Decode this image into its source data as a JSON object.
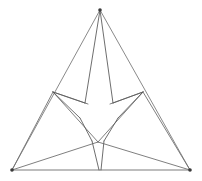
{
  "figure": {
    "background_color": "#ffffff",
    "line_color": "#7a7a7a",
    "accent_color": "#3a3a3a",
    "width": 202,
    "height": 181
  },
  "vertices": {
    "apex": {
      "label": "A",
      "x": 100,
      "y": 10
    },
    "bottom_left": {
      "label": "B",
      "x": 12,
      "y": 170
    },
    "bottom_right": {
      "label": "C",
      "x": 190,
      "y": 170
    },
    "mid_left": {
      "label": "M1",
      "x": 53,
      "y": 92
    },
    "mid_right": {
      "label": "M2",
      "x": 143,
      "y": 92
    },
    "mid_bottom": {
      "label": "M3",
      "x": 98,
      "y": 142
    },
    "notch_top_left": {
      "label": "N1",
      "x": 85,
      "y": 103
    },
    "notch_top_right": {
      "label": "N2",
      "x": 113,
      "y": 103
    },
    "notch_left": {
      "label": "N3",
      "x": 80,
      "y": 118
    },
    "notch_right": {
      "label": "N4",
      "x": 118,
      "y": 118
    },
    "star_bottom_left": {
      "label": "S1",
      "x": 92,
      "y": 141
    },
    "star_bottom_right": {
      "label": "S2",
      "x": 104,
      "y": 141
    },
    "star_center": {
      "label": "O",
      "x": 99,
      "y": 112
    }
  },
  "edges": {
    "outer_triangle": [
      {
        "name": "left-edge",
        "from": "apex",
        "to": "bottom_left"
      },
      {
        "name": "right-edge",
        "from": "apex",
        "to": "bottom_right"
      },
      {
        "name": "base-edge",
        "from": "bottom_left",
        "to": "bottom_right"
      }
    ],
    "medial_triangle": [
      {
        "name": "medial-top",
        "from": "mid_left",
        "to": "mid_right"
      },
      {
        "name": "medial-left",
        "from": "mid_left",
        "to": "mid_bottom"
      },
      {
        "name": "medial-right",
        "from": "mid_right",
        "to": "mid_bottom"
      }
    ],
    "cevians": [
      {
        "name": "apex-to-mid-left",
        "from": "apex",
        "to": "mid_left"
      },
      {
        "name": "apex-to-mid-right",
        "from": "apex",
        "to": "mid_right"
      },
      {
        "name": "left-to-mid-left",
        "from": "bottom_left",
        "to": "mid_left"
      },
      {
        "name": "right-to-mid-right",
        "from": "bottom_right",
        "to": "mid_right"
      },
      {
        "name": "left-to-mid-bottom",
        "from": "bottom_left",
        "to": "mid_bottom"
      },
      {
        "name": "right-to-mid-bottom",
        "from": "bottom_right",
        "to": "mid_bottom"
      }
    ],
    "star_arms": [
      {
        "name": "star-arm-top-left",
        "from": "apex",
        "to": "notch_top_left"
      },
      {
        "name": "star-arm-top-right",
        "from": "apex",
        "to": "notch_top_right"
      },
      {
        "name": "star-arm-left-upper",
        "from": "mid_left",
        "to": "notch_left"
      },
      {
        "name": "star-arm-right-upper",
        "from": "mid_right",
        "to": "notch_right"
      },
      {
        "name": "star-arm-bottom-left",
        "from": "bottom_left",
        "to": "star_bottom_left"
      },
      {
        "name": "star-arm-bottom-right",
        "from": "bottom_right",
        "to": "star_bottom_right"
      },
      {
        "name": "star-spine-left",
        "from": "star_bottom_left",
        "to": "bottom_left"
      },
      {
        "name": "star-spine-right",
        "from": "star_bottom_right",
        "to": "bottom_right"
      }
    ]
  },
  "star_outline_points": "100,10 85,103 53,92 80,118 92,141 100,170 104,141 118,118 143,92 113,103",
  "star_label": "three-pointed-concave-star",
  "counts": {
    "vertices_marked": 3,
    "triangles": 1,
    "star_points": 3
  }
}
